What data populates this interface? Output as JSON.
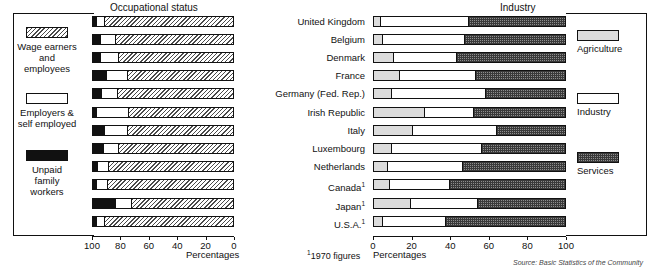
{
  "figure": {
    "left_panel_title": "Occupational status",
    "right_panel_title": "Industry",
    "percentages_caption_left": "Percentages",
    "percentages_caption_right": "Percentages",
    "footnote": "1970 figures",
    "footnote_marker": "1",
    "source": "Source: Basic Statistics of the Community"
  },
  "left_legend": [
    {
      "key": "wage",
      "label": "Wage earners\nand\nemployees",
      "fill": "hatch"
    },
    {
      "key": "employers",
      "label": "Employers &\nself employed",
      "fill": "white"
    },
    {
      "key": "unpaid",
      "label": "Unpaid\nfamily\nworkers",
      "fill": "black"
    }
  ],
  "right_legend": [
    {
      "key": "agriculture",
      "label": "Agriculture",
      "fill": "agri"
    },
    {
      "key": "industry",
      "label": "Industry",
      "fill": "ind"
    },
    {
      "key": "services",
      "label": "Services",
      "fill": "serv"
    }
  ],
  "countries": [
    {
      "name": "United Kingdom",
      "footnote": false
    },
    {
      "name": "Belgium",
      "footnote": false
    },
    {
      "name": "Denmark",
      "footnote": false
    },
    {
      "name": "France",
      "footnote": false
    },
    {
      "name": "Germany (Fed. Rep.)",
      "footnote": false
    },
    {
      "name": "Irish Republic",
      "footnote": false
    },
    {
      "name": "Italy",
      "footnote": false
    },
    {
      "name": "Luxembourg",
      "footnote": false
    },
    {
      "name": "Netherlands",
      "footnote": false
    },
    {
      "name": "Canada",
      "footnote": true
    },
    {
      "name": "Japan",
      "footnote": true
    },
    {
      "name": "U.S.A.",
      "footnote": true
    }
  ],
  "chart_data": [
    {
      "type": "bar",
      "orientation": "horizontal",
      "stacked": true,
      "id": "occupational-status",
      "title": "Occupational status",
      "xlabel": "Percentages",
      "ylabel": "",
      "xlim": [
        100,
        0
      ],
      "axis_reversed": true,
      "ticks": [
        100,
        80,
        60,
        40,
        20,
        0
      ],
      "grid": false,
      "legend_position": "left",
      "categories": [
        "United Kingdom",
        "Belgium",
        "Denmark",
        "France",
        "Germany (Fed. Rep.)",
        "Irish Republic",
        "Italy",
        "Luxembourg",
        "Netherlands",
        "Canada",
        "Japan",
        "U.S.A."
      ],
      "series": [
        {
          "name": "Unpaid family workers",
          "fill": "black",
          "values": [
            2,
            5,
            5,
            9,
            6,
            2,
            8,
            7,
            3,
            2,
            16,
            2
          ]
        },
        {
          "name": "Employers & self employed",
          "fill": "white",
          "values": [
            6,
            11,
            13,
            15,
            11,
            23,
            16,
            11,
            8,
            8,
            11,
            6
          ]
        },
        {
          "name": "Wage earners and employees",
          "fill": "hatch",
          "values": [
            92,
            84,
            82,
            76,
            83,
            75,
            76,
            82,
            89,
            90,
            73,
            92
          ]
        }
      ]
    },
    {
      "type": "bar",
      "orientation": "horizontal",
      "stacked": true,
      "id": "industry",
      "title": "Industry",
      "xlabel": "Percentages",
      "ylabel": "",
      "xlim": [
        0,
        100
      ],
      "axis_reversed": false,
      "ticks": [
        0,
        20,
        40,
        60,
        80,
        100
      ],
      "grid": false,
      "legend_position": "right",
      "categories": [
        "United Kingdom",
        "Belgium",
        "Denmark",
        "France",
        "Germany (Fed. Rep.)",
        "Irish Republic",
        "Italy",
        "Luxembourg",
        "Netherlands",
        "Canada",
        "Japan",
        "U.S.A."
      ],
      "series": [
        {
          "name": "Agriculture",
          "fill": "agri",
          "values": [
            3,
            4,
            10,
            13,
            9,
            26,
            20,
            9,
            7,
            8,
            19,
            4
          ]
        },
        {
          "name": "Industry",
          "fill": "ind",
          "values": [
            46,
            43,
            33,
            40,
            49,
            26,
            44,
            47,
            39,
            31,
            35,
            33
          ]
        },
        {
          "name": "Services",
          "fill": "serv",
          "values": [
            51,
            53,
            57,
            47,
            42,
            48,
            36,
            44,
            54,
            61,
            46,
            63
          ]
        }
      ]
    }
  ]
}
